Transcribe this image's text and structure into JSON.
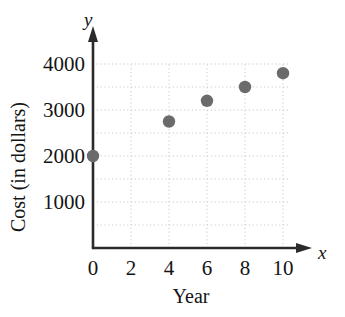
{
  "chart_data": {
    "type": "scatter",
    "title": "",
    "xlabel": "Year",
    "ylabel": "Cost (in dollars)",
    "x_axis_letter": "x",
    "y_axis_letter": "y",
    "xlim": [
      0,
      10.8
    ],
    "ylim": [
      0,
      4300
    ],
    "xticks": [
      0,
      2,
      4,
      6,
      8,
      10
    ],
    "xtick_labels": [
      "0",
      "2",
      "4",
      "6",
      "8",
      "10"
    ],
    "yticks": [
      1000,
      2000,
      3000,
      4000
    ],
    "ytick_labels": [
      "1000",
      "2000",
      "3000",
      "4000"
    ],
    "grid": true,
    "grid_style": "dotted",
    "grid_x_values": [
      2,
      4,
      6,
      8,
      10
    ],
    "grid_y_values": [
      500,
      1000,
      1500,
      2000,
      2500,
      3000,
      3500,
      4000
    ],
    "legend": "none",
    "x": [
      0,
      4,
      6,
      8,
      10
    ],
    "values": [
      2000,
      2750,
      3200,
      3500,
      3800
    ],
    "points": [
      {
        "x": 0,
        "y": 2000
      },
      {
        "x": 4,
        "y": 2750
      },
      {
        "x": 6,
        "y": 3200
      },
      {
        "x": 8,
        "y": 3500
      },
      {
        "x": 10,
        "y": 3800
      }
    ],
    "marker": "filled-circle",
    "marker_color": "#6b6b6b",
    "axis_color": "#2b2b2b",
    "grid_color": "#c9c9c9",
    "background_color": "#ffffff"
  }
}
